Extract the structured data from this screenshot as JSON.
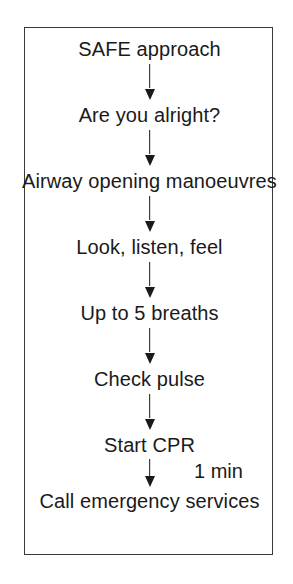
{
  "figure": {
    "type": "flowchart",
    "orientation": "vertical",
    "title": "",
    "frame_color": "#3a3a3c",
    "text_color": "#1a1a1a",
    "background_color": "#ffffff",
    "steps": [
      {
        "label": "SAFE approach"
      },
      {
        "label": "Are you alright?"
      },
      {
        "label": "Airway opening manoeuvres"
      },
      {
        "label": "Look, listen, feel"
      },
      {
        "label": "Up to 5 breaths"
      },
      {
        "label": "Check pulse"
      },
      {
        "label": "Start CPR"
      },
      {
        "label": "Call emergency services"
      }
    ],
    "connectors": [
      {
        "from": "SAFE approach",
        "to": "Are you alright?",
        "arrow": "down",
        "label": ""
      },
      {
        "from": "Are you alright?",
        "to": "Airway opening manoeuvres",
        "arrow": "down",
        "label": ""
      },
      {
        "from": "Airway opening manoeuvres",
        "to": "Look, listen, feel",
        "arrow": "down",
        "label": ""
      },
      {
        "from": "Look, listen, feel",
        "to": "Up to 5 breaths",
        "arrow": "down",
        "label": ""
      },
      {
        "from": "Up to 5 breaths",
        "to": "Check pulse",
        "arrow": "down",
        "label": ""
      },
      {
        "from": "Check pulse",
        "to": "Start CPR",
        "arrow": "down",
        "label": ""
      },
      {
        "from": "Start CPR",
        "to": "Call emergency services",
        "arrow": "down",
        "label": "1 min"
      }
    ],
    "annotations": [
      {
        "text": "1 min",
        "attached_to": "Start CPR -> Call emergency services"
      }
    ]
  }
}
